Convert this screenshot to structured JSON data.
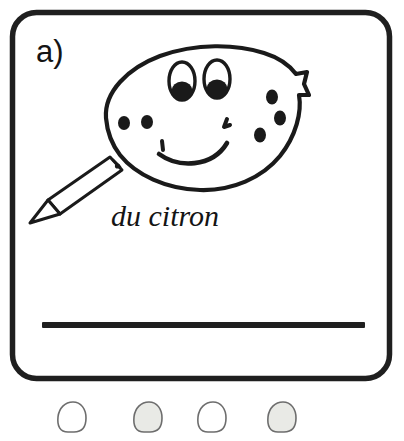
{
  "page": {
    "width": 404,
    "height": 441,
    "background_color": "#ffffff"
  },
  "card": {
    "name": "exercise-card",
    "item_label": "a)",
    "border_color": "#1f1f1f",
    "fill_color": "#ffffff"
  },
  "illustration": {
    "name": "lemon-face-drawing",
    "subject": "lemon with smiling face",
    "ink_color": "#1a1a1a",
    "features": {
      "eyes": 2,
      "pupils": 2,
      "mouth": "smile",
      "left_freckles": 2,
      "right_freckles": 3
    }
  },
  "pencil": {
    "name": "pencil-drawing",
    "body_color": "#ffffff",
    "outline_color": "#1a1a1a"
  },
  "caption": {
    "text": "du citron",
    "color": "#141414"
  },
  "answer_line": {
    "name": "answer-write-line",
    "color": "#1f1f1f"
  },
  "bubbles": [
    {
      "index": 1,
      "shaded": false,
      "fill": "#ffffff",
      "stroke": "#6d6d6d"
    },
    {
      "index": 2,
      "shaded": true,
      "fill": "#e9eae6",
      "stroke": "#6d6d6d"
    },
    {
      "index": 3,
      "shaded": false,
      "fill": "#ffffff",
      "stroke": "#6d6d6d"
    },
    {
      "index": 4,
      "shaded": true,
      "fill": "#e9eae6",
      "stroke": "#6d6d6d"
    }
  ]
}
